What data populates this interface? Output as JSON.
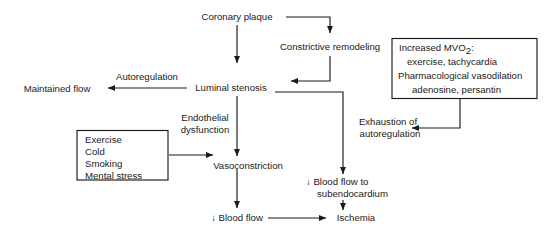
{
  "diagram": {
    "type": "flowchart",
    "colors": {
      "background": "#ffffff",
      "stroke": "#1a1a1a",
      "text": "#1a1a1a"
    },
    "nodes": {
      "coronary_plaque": "Coronary plaque",
      "constrictive_remodeling": "Constrictive remodeling",
      "luminal_stenosis": "Luminal stenosis",
      "autoregulation": "Autoregulation",
      "maintained_flow": "Maintained flow",
      "endothelial_dysfunction_line1": "Endothelial",
      "endothelial_dysfunction_line2": "dysfunction",
      "vasoconstriction": "Vasoconstriction",
      "blood_flow": "↓ Blood flow",
      "ischemia": "Ischemia",
      "exhaustion_line1": "Exhaustion of",
      "exhaustion_line2": "autoregulation",
      "subendocardial_line1": "↓ Blood flow to",
      "subendocardial_line2": "subendocardium"
    },
    "boxes": {
      "triggers": {
        "name": "triggers-box",
        "items": [
          "Exercise",
          "Cold",
          "Smoking",
          "Mental stress"
        ]
      },
      "mvo2": {
        "name": "mvo2-box",
        "line1_prefix": "Increased MVO",
        "line1_subscript": "2",
        "line1_suffix": ":",
        "line2": "exercise, tachycardia",
        "line3": "Pharmacological vasodilation",
        "line4": "adenosine, persantin"
      }
    },
    "edges": [
      {
        "from": "coronary_plaque",
        "to": "constrictive_remodeling",
        "label": ""
      },
      {
        "from": "coronary_plaque",
        "to": "luminal_stenosis",
        "label": ""
      },
      {
        "from": "constrictive_remodeling",
        "to": "luminal_stenosis",
        "label": ""
      },
      {
        "from": "luminal_stenosis",
        "to": "maintained_flow",
        "label": "Autoregulation"
      },
      {
        "from": "luminal_stenosis",
        "to": "vasoconstriction",
        "label": "Endothelial dysfunction"
      },
      {
        "from": "luminal_stenosis",
        "to": "subendocardial_line1",
        "label": ""
      },
      {
        "from": "triggers",
        "to": "vasoconstriction",
        "label": ""
      },
      {
        "from": "vasoconstriction",
        "to": "blood_flow",
        "label": ""
      },
      {
        "from": "blood_flow",
        "to": "ischemia",
        "label": ""
      },
      {
        "from": "subendocardial_line1",
        "to": "ischemia",
        "label": ""
      },
      {
        "from": "mvo2",
        "to": "exhaustion_line1",
        "label": ""
      }
    ]
  }
}
